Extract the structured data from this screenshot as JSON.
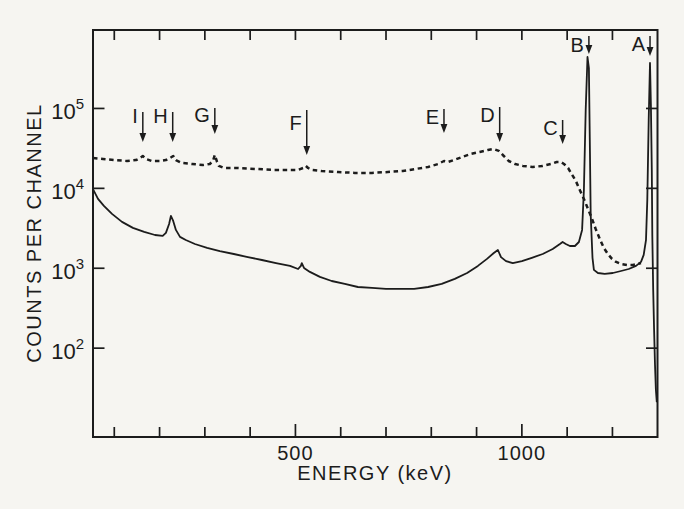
{
  "figure": {
    "paper_color": "#f6f5f1",
    "ink_color": "#1c1c1c"
  },
  "chart_data": {
    "type": "line",
    "title": "",
    "xlabel": "ENERGY (keV)",
    "ylabel": "COUNTS PER CHANNEL",
    "x_axis": {
      "unit": "keV",
      "scale": "linear",
      "domain_keV": [
        53,
        1299.5
      ],
      "ticks_keV": [
        100,
        200,
        300,
        400,
        500,
        600,
        700,
        800,
        900,
        1000,
        1100,
        1200
      ],
      "labeled_ticks": {
        "500": "500",
        "1000": "1000"
      }
    },
    "y_axis": {
      "unit": "counts per channel",
      "scale": "log",
      "domain_counts": [
        7.73,
        959000
      ],
      "ticks": [
        {
          "base": "10",
          "exponent": "5"
        },
        {
          "base": "10",
          "exponent": "4"
        },
        {
          "base": "10",
          "exponent": "3"
        },
        {
          "base": "10",
          "exponent": "2"
        }
      ]
    },
    "grid": false,
    "legend": false,
    "series": [
      {
        "name": "source-spectrum",
        "line_style": "solid",
        "points": [
          [
            53,
            9800
          ],
          [
            64,
            7380
          ],
          [
            77,
            6030
          ],
          [
            95,
            4790
          ],
          [
            117,
            3800
          ],
          [
            141,
            3200
          ],
          [
            166,
            2850
          ],
          [
            190,
            2610
          ],
          [
            207,
            2540
          ],
          [
            214,
            2770
          ],
          [
            221,
            3580
          ],
          [
            225,
            4520
          ],
          [
            230,
            3910
          ],
          [
            236,
            3020
          ],
          [
            245,
            2470
          ],
          [
            258,
            2260
          ],
          [
            278,
            2010
          ],
          [
            305,
            1800
          ],
          [
            333,
            1640
          ],
          [
            364,
            1510
          ],
          [
            395,
            1380
          ],
          [
            426,
            1270
          ],
          [
            457,
            1160
          ],
          [
            488,
            1070
          ],
          [
            506,
            980
          ],
          [
            512,
            1070
          ],
          [
            514,
            1160
          ],
          [
            519,
            1010
          ],
          [
            532,
            900
          ],
          [
            554,
            780
          ],
          [
            580,
            693
          ],
          [
            609,
            637
          ],
          [
            638,
            583
          ],
          [
            669,
            567
          ],
          [
            700,
            551
          ],
          [
            731,
            551
          ],
          [
            762,
            551
          ],
          [
            793,
            583
          ],
          [
            823,
            637
          ],
          [
            852,
            735
          ],
          [
            879,
            873
          ],
          [
            903,
            1070
          ],
          [
            923,
            1310
          ],
          [
            938,
            1550
          ],
          [
            947,
            1690
          ],
          [
            954,
            1380
          ],
          [
            965,
            1230
          ],
          [
            980,
            1160
          ],
          [
            1000,
            1230
          ],
          [
            1022,
            1350
          ],
          [
            1046,
            1510
          ],
          [
            1068,
            1740
          ],
          [
            1084,
            2010
          ],
          [
            1090,
            2130
          ],
          [
            1097,
            2010
          ],
          [
            1106,
            1900
          ],
          [
            1117,
            1900
          ],
          [
            1126,
            2130
          ],
          [
            1133,
            3020
          ],
          [
            1137,
            9550
          ],
          [
            1141,
            95700
          ],
          [
            1145,
            441000
          ],
          [
            1148,
            321000
          ],
          [
            1150,
            40400
          ],
          [
            1152,
            4650
          ],
          [
            1156,
            1350
          ],
          [
            1159,
            953
          ],
          [
            1168,
            873
          ],
          [
            1183,
            849
          ],
          [
            1201,
            873
          ],
          [
            1219,
            925
          ],
          [
            1236,
            980
          ],
          [
            1252,
            1070
          ],
          [
            1263,
            1200
          ],
          [
            1269,
            1470
          ],
          [
            1274,
            2260
          ],
          [
            1277,
            7160
          ],
          [
            1280,
            71800
          ],
          [
            1283,
            371000
          ],
          [
            1285,
            111000
          ],
          [
            1287,
            17000
          ],
          [
            1288,
            2610
          ],
          [
            1290,
            536
          ],
          [
            1292,
            169
          ],
          [
            1294,
            62
          ],
          [
            1296,
            30
          ],
          [
            1298,
            21
          ]
        ]
      },
      {
        "name": "background-spectrum",
        "line_style": "dashed",
        "points": [
          [
            53,
            24000
          ],
          [
            75,
            23300
          ],
          [
            101,
            22600
          ],
          [
            128,
            22000
          ],
          [
            148,
            22600
          ],
          [
            157,
            24000
          ],
          [
            163,
            25400
          ],
          [
            170,
            23300
          ],
          [
            183,
            22000
          ],
          [
            201,
            22000
          ],
          [
            214,
            22600
          ],
          [
            223,
            24000
          ],
          [
            230,
            25400
          ],
          [
            236,
            22600
          ],
          [
            249,
            20800
          ],
          [
            272,
            20200
          ],
          [
            296,
            19600
          ],
          [
            311,
            20200
          ],
          [
            318,
            22000
          ],
          [
            322,
            26200
          ],
          [
            327,
            21400
          ],
          [
            331,
            19100
          ],
          [
            342,
            18000
          ],
          [
            373,
            18000
          ],
          [
            411,
            17500
          ],
          [
            448,
            17000
          ],
          [
            483,
            17000
          ],
          [
            506,
            17000
          ],
          [
            517,
            18000
          ],
          [
            523,
            19100
          ],
          [
            528,
            18000
          ],
          [
            536,
            17000
          ],
          [
            558,
            16500
          ],
          [
            594,
            16000
          ],
          [
            631,
            15600
          ],
          [
            669,
            15600
          ],
          [
            704,
            16000
          ],
          [
            737,
            16500
          ],
          [
            766,
            17500
          ],
          [
            793,
            18500
          ],
          [
            815,
            20200
          ],
          [
            828,
            22000
          ],
          [
            837,
            21400
          ],
          [
            850,
            22600
          ],
          [
            868,
            24700
          ],
          [
            887,
            26900
          ],
          [
            907,
            28500
          ],
          [
            925,
            30200
          ],
          [
            938,
            31100
          ],
          [
            949,
            29400
          ],
          [
            960,
            25400
          ],
          [
            971,
            22000
          ],
          [
            985,
            20200
          ],
          [
            1002,
            19100
          ],
          [
            1024,
            18500
          ],
          [
            1046,
            19100
          ],
          [
            1064,
            20200
          ],
          [
            1077,
            21400
          ],
          [
            1086,
            21400
          ],
          [
            1093,
            20200
          ],
          [
            1102,
            18000
          ],
          [
            1110,
            15100
          ],
          [
            1119,
            12400
          ],
          [
            1128,
            9550
          ],
          [
            1137,
            7380
          ],
          [
            1146,
            5520
          ],
          [
            1155,
            4140
          ],
          [
            1163,
            3100
          ],
          [
            1172,
            2330
          ],
          [
            1181,
            1800
          ],
          [
            1190,
            1510
          ],
          [
            1199,
            1310
          ],
          [
            1208,
            1200
          ],
          [
            1219,
            1130
          ],
          [
            1232,
            1100
          ],
          [
            1245,
            1100
          ],
          [
            1256,
            1130
          ],
          [
            1263,
            1160
          ]
        ]
      }
    ],
    "peaks": [
      {
        "label": "I",
        "energy_keV": 163,
        "arrow_top_y": 112,
        "arrow_tip_y": 142,
        "label_baseline_y": 123
      },
      {
        "label": "H",
        "energy_keV": 229,
        "arrow_top_y": 112,
        "arrow_tip_y": 142,
        "label_baseline_y": 123
      },
      {
        "label": "G",
        "energy_keV": 322,
        "arrow_top_y": 108,
        "arrow_tip_y": 134,
        "label_baseline_y": 122
      },
      {
        "label": "F",
        "energy_keV": 525,
        "arrow_top_y": 110,
        "arrow_tip_y": 155,
        "label_baseline_y": 130
      },
      {
        "label": "E",
        "energy_keV": 828,
        "arrow_top_y": 109,
        "arrow_tip_y": 133,
        "label_baseline_y": 124
      },
      {
        "label": "D",
        "energy_keV": 951,
        "arrow_top_y": 107,
        "arrow_tip_y": 142,
        "label_baseline_y": 122
      },
      {
        "label": "C",
        "energy_keV": 1090,
        "arrow_top_y": 120,
        "arrow_tip_y": 144,
        "label_baseline_y": 135
      },
      {
        "label": "B",
        "energy_keV": 1148,
        "arrow_top_y": 36,
        "arrow_tip_y": 54,
        "label_baseline_y": 52
      },
      {
        "label": "A",
        "energy_keV": 1283,
        "arrow_top_y": 36,
        "arrow_tip_y": 56,
        "label_baseline_y": 51
      }
    ],
    "layout": {
      "plot_box_px": {
        "x": 93,
        "y": 30,
        "w": 564.5,
        "h": 407
      },
      "x_title_anchor_px": {
        "x": 375,
        "y": 480
      },
      "y_title_anchor_px": {
        "x": 41,
        "y": 233
      },
      "x_tick_label_baseline_y": 460,
      "tick_len_px": 10,
      "labeled_tick_len_px": 13
    }
  }
}
